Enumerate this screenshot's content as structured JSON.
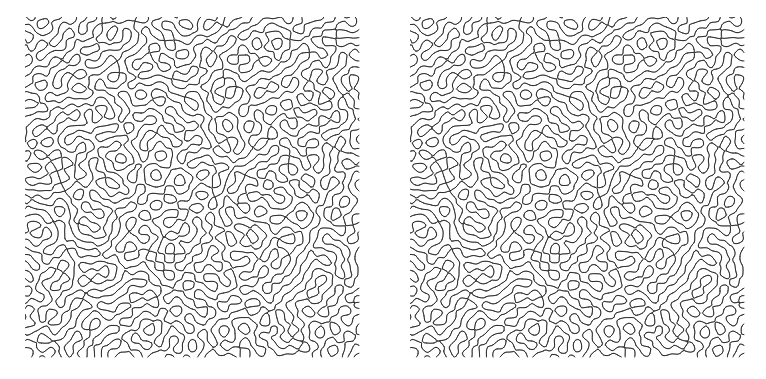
{
  "figure": {
    "title": "",
    "width": 766,
    "height": 379,
    "background_color": "#ffffff",
    "layout": "two-panels-side-by-side",
    "has_axes": false,
    "has_labels": false,
    "has_legend": false,
    "has_text": false
  },
  "panels": [
    {
      "id": "left",
      "label": "",
      "x": 25,
      "y": 17,
      "width": 336,
      "height": 342,
      "line_color": "#2e2e2e",
      "background_color": "#ffffff",
      "line_width": 1
    },
    {
      "id": "right",
      "label": "",
      "x": 410,
      "y": 17,
      "width": 336,
      "height": 342,
      "line_color": "#2e2e2e",
      "background_color": "#ffffff",
      "line_width": 1
    }
  ],
  "chart_data": {
    "type": "heatmap",
    "title": "",
    "subtitle": "",
    "xlabel": "",
    "ylabel": "",
    "grid": false,
    "legend_position": "none",
    "tick_labels_x": [],
    "tick_labels_y": [],
    "annotations": [],
    "series": [
      {
        "name": "left-panel-isolines",
        "pattern": "labyrinthine",
        "seed": 20240117,
        "wavelength_px": 13.5,
        "threshold": 0.0,
        "contour_levels": [
          0.0
        ],
        "octaves": 1,
        "anisotropy": 1.0,
        "line_color": "#2e2e2e"
      },
      {
        "name": "right-panel-isolines",
        "pattern": "labyrinthine",
        "seed": 20240117,
        "wavelength_px": 13.5,
        "threshold": 0.0,
        "contour_levels": [
          0.0
        ],
        "octaves": 1,
        "anisotropy": 1.0,
        "line_color": "#2e2e2e"
      }
    ],
    "axis_ranges": {
      "xlim": [
        0,
        336
      ],
      "ylim": [
        0,
        342
      ]
    }
  }
}
